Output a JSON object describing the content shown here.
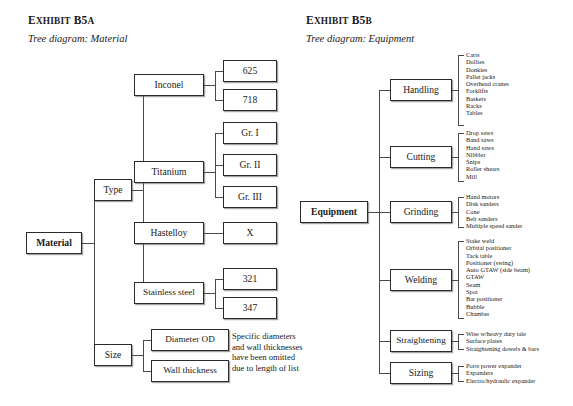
{
  "exhibit_a": {
    "title_prefix": "E",
    "title_smallcaps": "XHIBIT",
    "title_rest": " B5",
    "title_suffix": "A",
    "title_full": "Exhibit B5a",
    "subtitle": "Tree diagram: Material",
    "root": "Material",
    "branches": [
      {
        "label": "Type",
        "children": [
          {
            "label": "Inconel",
            "leaves": [
              "625",
              "718"
            ]
          },
          {
            "label": "Titanium",
            "leaves": [
              "Gr. I",
              "Gr. II",
              "Gr. III"
            ]
          },
          {
            "label": "Hastelloy",
            "leaves": [
              "X"
            ]
          },
          {
            "label": "Stainless steel",
            "leaves": [
              "321",
              "347"
            ]
          }
        ]
      },
      {
        "label": "Size",
        "children": [
          {
            "label": "Diameter OD",
            "leaves": []
          },
          {
            "label": "Wall thickness",
            "leaves": []
          }
        ]
      }
    ],
    "note_lines": [
      "Specific diameters",
      "and wall thicknesses",
      "have been omitted",
      "due to length of list"
    ]
  },
  "exhibit_b": {
    "title_prefix": "E",
    "title_smallcaps": "XHIBIT",
    "title_rest": " B5",
    "title_suffix": "B",
    "title_full": "Exhibit B5b",
    "subtitle": "Tree diagram: Equipment",
    "root": "Equipment",
    "branches": [
      {
        "label": "Handling",
        "items": [
          "Carts",
          "Dollies",
          "Donkies",
          "Pallet jacks",
          "Overhead cranes",
          "Forklifts",
          "Baskets",
          "Racks",
          "Tables"
        ]
      },
      {
        "label": "Cutting",
        "items": [
          "Drop saws",
          "Band saws",
          "Hand saws",
          "Nibbler",
          "Snips",
          "Roller shears",
          "Mill"
        ]
      },
      {
        "label": "Grinding",
        "items": [
          "Hand motors",
          "Disk sanders",
          "Cone",
          "Belt sanders",
          "Multiple speed sander"
        ]
      },
      {
        "label": "Welding",
        "items": [
          "Stake weld",
          "Orbital positioner",
          "Tack table",
          "Positioner (swing)",
          "Auto GTAW (side beam)",
          "GTAW",
          "Seam",
          "Spot",
          "Bar positioner",
          "Bubble",
          "Chamber"
        ]
      },
      {
        "label": "Straightening",
        "items": [
          "Wise w/heavy duty tale",
          "Surface plates",
          "Straightening dowels & bars"
        ]
      },
      {
        "label": "Sizing",
        "items": [
          "Ports power expander",
          "Expanders",
          "Electro/hydraulic expander"
        ]
      }
    ]
  },
  "colors": {
    "box_border": "#2b2b2b",
    "line": "#4a4a4a",
    "text": "#1a1a1a",
    "background": "#ffffff"
  }
}
